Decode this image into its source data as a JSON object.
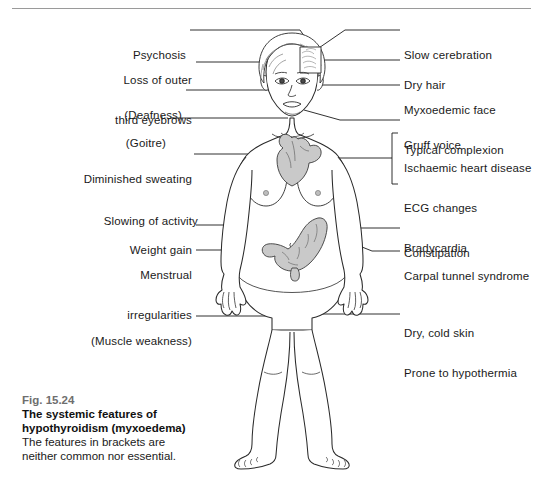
{
  "figure": {
    "number": "Fig. 15.24",
    "title_line1": "The systemic features of",
    "title_line2": "hypothyroidism (myxoedema)",
    "note_line1": "The features in brackets are",
    "note_line2": "neither common nor essential."
  },
  "labels_left": [
    {
      "name": "psychosis",
      "lines": [
        "Psychosis"
      ]
    },
    {
      "name": "loss-of-outer-third-eyebrows",
      "lines": [
        "Loss of outer",
        "third eyebrows"
      ]
    },
    {
      "name": "deafness",
      "lines": [
        "(Deafness)"
      ]
    },
    {
      "name": "goitre",
      "lines": [
        "(Goitre)"
      ]
    },
    {
      "name": "diminished-sweating",
      "lines": [
        "Diminished sweating"
      ]
    },
    {
      "name": "slowing-of-activity",
      "lines": [
        "Slowing of activity"
      ]
    },
    {
      "name": "weight-gain",
      "lines": [
        "Weight gain"
      ]
    },
    {
      "name": "menstrual-irregularities",
      "lines": [
        "Menstrual",
        "irregularities"
      ]
    },
    {
      "name": "muscle-weakness",
      "lines": [
        "(Muscle weakness)"
      ]
    }
  ],
  "labels_right": [
    {
      "name": "slow-cerebration",
      "lines": [
        "Slow cerebration"
      ]
    },
    {
      "name": "dry-hair",
      "lines": [
        "Dry hair"
      ]
    },
    {
      "name": "myxoedemic-face",
      "lines": [
        "Myxoedemic face",
        "Typical complexion"
      ]
    },
    {
      "name": "gruff-voice",
      "lines": [
        "Gruff voice"
      ]
    },
    {
      "name": "cardiac-group",
      "lines": [
        "Ischaemic heart disease",
        "ECG changes",
        "Bradycardia"
      ]
    },
    {
      "name": "constipation",
      "lines": [
        "Constipation"
      ]
    },
    {
      "name": "carpal-tunnel-syndrome",
      "lines": [
        "Carpal tunnel syndrome"
      ]
    },
    {
      "name": "skin-group",
      "lines": [
        "Dry, cold skin",
        "Prone to hypothermia"
      ]
    }
  ],
  "colors": {
    "ink": "#1a1a1a",
    "organ_fill": "#c9c9c9",
    "organ_stroke": "#3a3a3a",
    "rule": "#9a9a9a",
    "fignum": "#6e6e6e"
  }
}
